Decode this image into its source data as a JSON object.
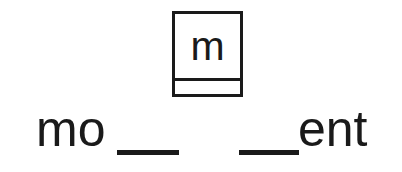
{
  "page": {
    "background_color": "#ffffff",
    "ink_color": "#1a1a1a"
  },
  "letter_card": {
    "letter": "m",
    "name": "letter-tile-m",
    "border_color": "#1a1a1a",
    "has_bottom_strip": true
  },
  "word_exercise": {
    "prefix": "mo",
    "suffix": "ent",
    "separator": "•",
    "blanks": [
      {
        "id": "blank-1",
        "value": ""
      },
      {
        "id": "blank-2",
        "value": ""
      }
    ],
    "full_display": "mo__ • __ent"
  }
}
